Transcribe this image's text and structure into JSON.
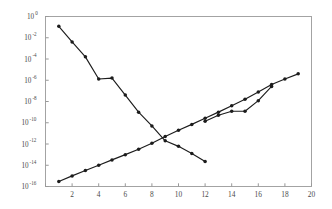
{
  "chart_data": {
    "type": "line",
    "title": "",
    "subtitle": "",
    "xlabel": "",
    "ylabel": "",
    "xlim": [
      0,
      20
    ],
    "ylim": [
      1e-16,
      1
    ],
    "yscale": "log",
    "xscale": "linear",
    "grid": false,
    "legend": null,
    "legend_position": "none",
    "xticks": [
      0,
      2,
      4,
      6,
      8,
      10,
      12,
      14,
      16,
      18,
      20
    ],
    "xtick_labels": [
      "",
      "2",
      "4",
      "6",
      "8",
      "10",
      "12",
      "14",
      "16",
      "18",
      "20"
    ],
    "yticks": [
      1.0,
      0.01,
      0.0001,
      1e-06,
      1e-08,
      1e-10,
      1e-12,
      1e-14,
      1e-16
    ],
    "ytick_labels": [
      "10^0",
      "10^-2",
      "10^-4",
      "10^-6",
      "10^-8",
      "10^-10",
      "10^-12",
      "10^-14",
      "10^-16"
    ],
    "ytick_mantissa": [
      "10",
      "10",
      "10",
      "10",
      "10",
      "10",
      "10",
      "10",
      "10"
    ],
    "ytick_exponents": [
      "0",
      "-2",
      "-4",
      "-6",
      "-8",
      "-10",
      "-12",
      "-14",
      "-16"
    ],
    "marker": "filled-circle",
    "color": "#1c1c1c",
    "series": [
      {
        "name": "decreasing-error-curve",
        "x": [
          1,
          2,
          3,
          4,
          5,
          6,
          7,
          8,
          9,
          10,
          11,
          12
        ],
        "values": [
          0.12,
          0.004,
          0.00016,
          1.3e-06,
          1.6e-06,
          4e-08,
          1e-09,
          5e-11,
          2e-12,
          6e-13,
          1.3e-13,
          2.2e-14
        ]
      },
      {
        "name": "increasing-error-curve-a",
        "x": [
          1,
          2,
          3,
          4,
          5,
          6,
          7,
          8,
          9,
          10,
          11,
          12,
          13,
          14,
          15,
          16,
          17,
          18,
          19
        ],
        "values": [
          3e-16,
          1e-15,
          3.2e-15,
          1e-14,
          3.2e-14,
          1e-13,
          3.2e-13,
          1.2e-12,
          5e-12,
          2e-11,
          7e-11,
          2.6e-10,
          1e-09,
          4e-09,
          1.6e-08,
          8e-08,
          4e-07,
          1.3e-06,
          4e-06
        ]
      },
      {
        "name": "increasing-error-curve-b",
        "x": [
          12,
          13,
          14,
          15,
          16,
          17
        ],
        "values": [
          1.4e-10,
          5e-10,
          1.2e-09,
          1.2e-09,
          1.2e-08,
          2.6e-07
        ]
      }
    ]
  },
  "axes": {
    "x_axis_name": "x-axis",
    "y_axis_name": "y-axis-log"
  }
}
